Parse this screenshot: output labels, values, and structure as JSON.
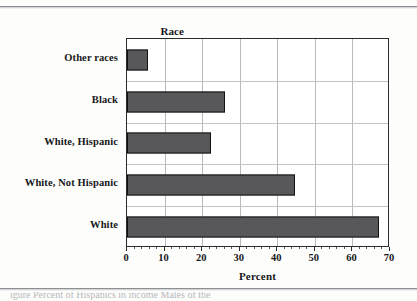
{
  "chart_data": {
    "type": "bar",
    "orientation": "horizontal",
    "title": "",
    "group_label": "Race",
    "xlabel": "Percent",
    "ylabel": "Race",
    "xlim": [
      0,
      70
    ],
    "xticks": [
      0,
      10,
      20,
      30,
      40,
      50,
      60,
      70
    ],
    "xtick_labels": [
      "0",
      "10",
      "20",
      "30",
      "40",
      "50",
      "60",
      "70"
    ],
    "grid": true,
    "legend": null,
    "categories": [
      "Other races",
      "Black",
      "White, Hispanic",
      "White, Not Hispanic",
      "White"
    ],
    "values": [
      5.5,
      26.0,
      22.3,
      44.8,
      67.0
    ],
    "bar_color": "#58585a",
    "bar_border_color": "#111214",
    "gridline_color": "#b9babd",
    "axis_color": "#2a2b2d"
  },
  "caption": {
    "clipped_text": "igure  Percent  of Hispanics  in income  Males  of the"
  }
}
